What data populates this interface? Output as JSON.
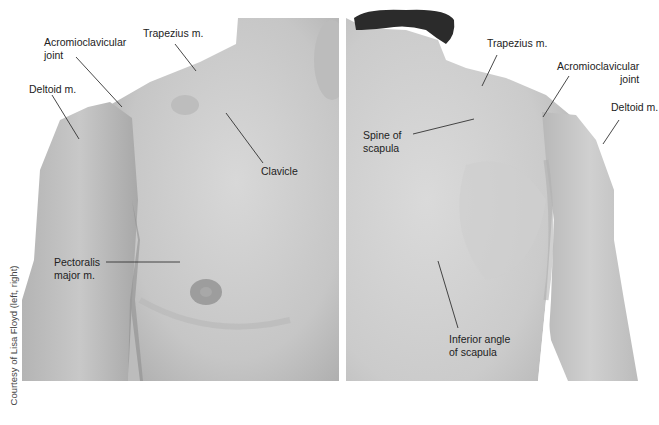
{
  "figure": {
    "credit": "Courtesy of Lisa Floyd (left, right)",
    "colors": {
      "skin_light": "#d9d9d9",
      "skin_mid": "#c4c4c4",
      "skin_dark": "#a9a9a9",
      "hair": "#2b2b2b",
      "leader": "#333333",
      "text": "#222222"
    }
  },
  "left_panel": {
    "view": "anterior",
    "labels": [
      {
        "id": "acromioclavicular",
        "line1": "Acromioclavicular",
        "line2": "joint"
      },
      {
        "id": "trapezius",
        "line1": "Trapezius m."
      },
      {
        "id": "deltoid",
        "line1": "Deltoid m."
      },
      {
        "id": "clavicle",
        "line1": "Clavicle"
      },
      {
        "id": "pectoralis",
        "line1": "Pectoralis",
        "line2": "major m."
      }
    ]
  },
  "right_panel": {
    "view": "posterior",
    "labels": [
      {
        "id": "trapezius",
        "line1": "Trapezius m."
      },
      {
        "id": "acromioclavicular",
        "line1": "Acromioclavicular",
        "line2": "joint"
      },
      {
        "id": "deltoid",
        "line1": "Deltoid m."
      },
      {
        "id": "spine-scapula",
        "line1": "Spine of",
        "line2": "scapula"
      },
      {
        "id": "inferior-angle",
        "line1": "Inferior angle",
        "line2": "of scapula"
      }
    ]
  }
}
